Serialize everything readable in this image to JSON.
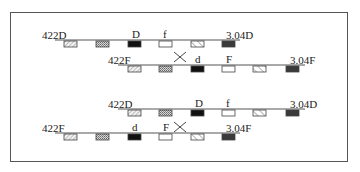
{
  "diagram": {
    "pattern_legend": {
      "diag_light": "light diagonal hatch",
      "crosshatch": "crosshatched",
      "black": "solid black",
      "white": "empty white",
      "diag_back": "back-diagonal hatch",
      "dark": "dark grey"
    },
    "rows": [
      {
        "id": "row1",
        "left_label": "422D",
        "right_label": "3.04D",
        "line": {
          "x1": 55,
          "x2": 240,
          "y": 40
        },
        "left_label_pos": {
          "x": 42,
          "y": 30
        },
        "right_label_pos": {
          "x": 226,
          "y": 30
        },
        "boxes": [
          {
            "x": 64,
            "pattern": "diag_light",
            "label": ""
          },
          {
            "x": 96,
            "pattern": "crosshatch",
            "label": ""
          },
          {
            "x": 128,
            "pattern": "black",
            "label": "D"
          },
          {
            "x": 159,
            "pattern": "white",
            "label": "f"
          },
          {
            "x": 191,
            "pattern": "diag_back",
            "label": ""
          },
          {
            "x": 222,
            "pattern": "dark",
            "label": ""
          }
        ]
      },
      {
        "id": "row2",
        "left_label": "422F",
        "right_label": "3.04F",
        "line": {
          "x1": 118,
          "x2": 305,
          "y": 65
        },
        "left_label_pos": {
          "x": 108,
          "y": 55
        },
        "right_label_pos": {
          "x": 290,
          "y": 55
        },
        "boxes": [
          {
            "x": 128,
            "pattern": "diag_light",
            "label": ""
          },
          {
            "x": 159,
            "pattern": "crosshatch",
            "label": ""
          },
          {
            "x": 191,
            "pattern": "black",
            "label": "d"
          },
          {
            "x": 222,
            "pattern": "white",
            "label": "F"
          },
          {
            "x": 253,
            "pattern": "diag_back",
            "label": ""
          },
          {
            "x": 286,
            "pattern": "dark",
            "label": ""
          }
        ]
      },
      {
        "id": "row3",
        "left_label": "422D",
        "right_label": "3.04D",
        "line": {
          "x1": 118,
          "x2": 305,
          "y": 109
        },
        "left_label_pos": {
          "x": 108,
          "y": 99
        },
        "right_label_pos": {
          "x": 290,
          "y": 99
        },
        "boxes": [
          {
            "x": 128,
            "pattern": "diag_light",
            "label": ""
          },
          {
            "x": 159,
            "pattern": "crosshatch",
            "label": ""
          },
          {
            "x": 191,
            "pattern": "black",
            "label": "D"
          },
          {
            "x": 222,
            "pattern": "white",
            "label": "f"
          },
          {
            "x": 253,
            "pattern": "diag_back",
            "label": ""
          },
          {
            "x": 286,
            "pattern": "dark",
            "label": ""
          }
        ]
      },
      {
        "id": "row4",
        "left_label": "422F",
        "right_label": "3.04F",
        "line": {
          "x1": 55,
          "x2": 240,
          "y": 133
        },
        "left_label_pos": {
          "x": 42,
          "y": 123
        },
        "right_label_pos": {
          "x": 226,
          "y": 123
        },
        "boxes": [
          {
            "x": 64,
            "pattern": "diag_light",
            "label": ""
          },
          {
            "x": 96,
            "pattern": "crosshatch",
            "label": ""
          },
          {
            "x": 128,
            "pattern": "black",
            "label": "d"
          },
          {
            "x": 159,
            "pattern": "white",
            "label": "F"
          },
          {
            "x": 191,
            "pattern": "diag_back",
            "label": ""
          },
          {
            "x": 222,
            "pattern": "dark",
            "label": ""
          }
        ]
      }
    ],
    "crossovers": [
      {
        "x": 180,
        "y": 57,
        "between": [
          "row1",
          "row2"
        ]
      },
      {
        "x": 180,
        "y": 127,
        "between": [
          "row3",
          "row4"
        ]
      }
    ]
  }
}
